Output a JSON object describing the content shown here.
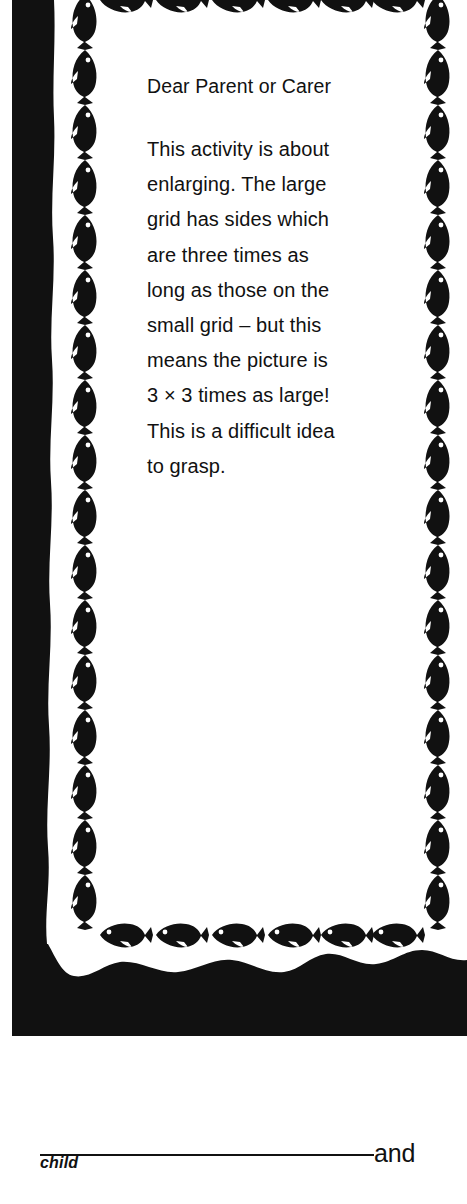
{
  "page": {
    "background_color": "#ffffff",
    "ink_color": "#111111"
  },
  "note": {
    "salutation": "Dear Parent or Carer",
    "body": "This activity is about\nenlarging. The large\ngrid has sides which\nare three times as\nlong as those on the\nsmall grid – but this\nmeans the picture is\n3 × 3 times as large!\nThis is a difficult idea\nto grasp.",
    "border": {
      "motif": "fish-icon",
      "motif_color": "#111111",
      "frame_color": "#111111",
      "top_fish_count": 7,
      "bottom_fish_count": 7,
      "left_fish_count": 17,
      "right_fish_count": 17
    }
  },
  "signature": {
    "connector_label": "and",
    "caption": "child",
    "rule_color": "#111111"
  }
}
